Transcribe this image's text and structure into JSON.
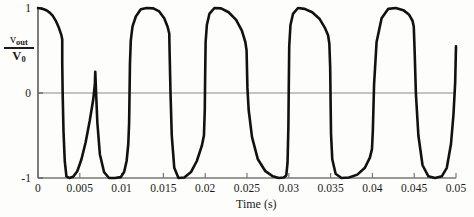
{
  "chart_data": {
    "type": "line",
    "title": "",
    "xlabel": "Time (s)",
    "ylabel": "v_out / V_0",
    "ylabel_numerator": "v",
    "ylabel_numerator_sub": "out",
    "ylabel_denominator": "V",
    "ylabel_denominator_sub": "0",
    "xlim": [
      0,
      0.05
    ],
    "ylim": [
      -1,
      1
    ],
    "grid": false,
    "legend": null,
    "xticks": [
      0,
      0.005,
      0.01,
      0.015,
      0.02,
      0.025,
      0.03,
      0.035,
      0.04,
      0.045,
      0.05
    ],
    "xticklabels": [
      "0",
      "0.005",
      "0.01",
      "0.015",
      "0.02",
      "0.025",
      "0.03",
      "0.035",
      "0.04",
      "0.045",
      "0.05"
    ],
    "yticks": [
      -1,
      0,
      1
    ],
    "yticklabels": [
      "-1",
      "0",
      "1"
    ],
    "zero_line": 0,
    "series": [
      {
        "name": "v_out/V_0",
        "color": "#111111",
        "linewidth": 2.6,
        "x": [
          0.0,
          0.00035,
          0.0007,
          0.00105,
          0.0014,
          0.00175,
          0.0021,
          0.00245,
          0.0028,
          0.0029,
          0.0029,
          0.00295,
          0.00305,
          0.0032,
          0.0034,
          0.00375,
          0.0042,
          0.0047,
          0.0052,
          0.0057,
          0.0062,
          0.0066,
          0.0068,
          0.00685,
          0.00695,
          0.0071,
          0.0074,
          0.0079,
          0.0085,
          0.0092,
          0.0099,
          0.0103,
          0.0106,
          0.0108,
          0.0109,
          0.01095,
          0.011,
          0.0111,
          0.0113,
          0.0117,
          0.0123,
          0.013,
          0.0138,
          0.0145,
          0.0151,
          0.0155,
          0.0157,
          0.01575,
          0.01585,
          0.016,
          0.0163,
          0.0168,
          0.0175,
          0.0183,
          0.019,
          0.0196,
          0.01985,
          0.01995,
          0.02,
          0.02005,
          0.0202,
          0.0205,
          0.0211,
          0.0219,
          0.0228,
          0.0237,
          0.0244,
          0.0248,
          0.02495,
          0.025,
          0.02505,
          0.0252,
          0.0256,
          0.0263,
          0.0272,
          0.0281,
          0.0288,
          0.0294,
          0.0297,
          0.02985,
          0.02995,
          0.03,
          0.03005,
          0.0302,
          0.0305,
          0.0311,
          0.0319,
          0.0328,
          0.0337,
          0.0343,
          0.0347,
          0.03485,
          0.03495,
          0.035,
          0.03505,
          0.0352,
          0.0356,
          0.0363,
          0.0372,
          0.0382,
          0.0391,
          0.0397,
          0.03995,
          0.04005,
          0.0402,
          0.0405,
          0.0411,
          0.0419,
          0.0428,
          0.0437,
          0.0444,
          0.0448,
          0.04495,
          0.04505,
          0.0452,
          0.0455,
          0.046,
          0.0467,
          0.0475,
          0.0483,
          0.0489,
          0.0494,
          0.0497,
          0.0499,
          0.05
        ],
        "y": [
          1.0,
          0.995,
          0.985,
          0.97,
          0.945,
          0.91,
          0.855,
          0.78,
          0.68,
          0.63,
          0.35,
          0.0,
          -0.45,
          -0.8,
          -0.98,
          -1.0,
          -0.985,
          -0.92,
          -0.78,
          -0.58,
          -0.32,
          -0.08,
          0.1,
          0.25,
          0.0,
          -0.35,
          -0.72,
          -0.93,
          -1.0,
          -1.0,
          -0.99,
          -0.93,
          -0.8,
          -0.6,
          -0.35,
          0.0,
          0.35,
          0.62,
          0.78,
          0.9,
          0.985,
          1.0,
          0.995,
          0.96,
          0.88,
          0.78,
          0.7,
          0.45,
          0.0,
          -0.5,
          -0.88,
          -1.0,
          -0.995,
          -0.93,
          -0.8,
          -0.62,
          -0.5,
          -0.2,
          0.25,
          0.6,
          0.8,
          0.93,
          1.0,
          0.995,
          0.95,
          0.86,
          0.73,
          0.6,
          0.5,
          0.28,
          0.06,
          -0.2,
          -0.52,
          -0.78,
          -0.92,
          -0.98,
          -1.0,
          -0.995,
          -0.97,
          -0.82,
          -0.4,
          0.1,
          0.55,
          0.8,
          0.93,
          1.0,
          0.99,
          0.95,
          0.87,
          0.77,
          0.68,
          0.58,
          0.3,
          -0.1,
          -0.48,
          -0.78,
          -0.95,
          -1.0,
          -0.995,
          -0.96,
          -0.88,
          -0.76,
          -0.66,
          -0.45,
          0.1,
          0.6,
          0.88,
          0.99,
          1.0,
          0.975,
          0.92,
          0.85,
          0.78,
          0.5,
          0.0,
          -0.5,
          -0.85,
          -0.98,
          -1.0,
          -0.98,
          -0.88,
          -0.6,
          -0.25,
          0.12,
          0.55
        ]
      }
    ]
  },
  "axes": {
    "origin_x_label": "0",
    "x_axis_title": "Time (s)"
  }
}
